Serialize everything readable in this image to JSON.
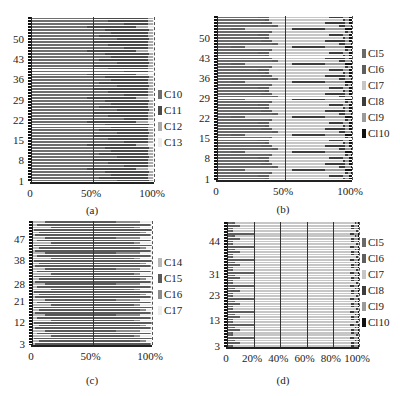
{
  "colors": {
    "C10": "#6e6e6e",
    "C11": "#4a4a4a",
    "C12": "#a9a9a9",
    "C13": "#ececec",
    "C14": "#b8b8b8",
    "C15": "#5a5a5a",
    "C16": "#8c8c8c",
    "C17": "#ededed",
    "Cl5": "#6a6a6a",
    "Cl6": "#5e5e5e",
    "Cl7": "#c6c6c6",
    "Cl8": "#3c3c3c",
    "Cl9": "#9a9a9a",
    "Cl10": "#111111"
  },
  "chart_data": [
    {
      "id": "a",
      "type": "bar",
      "orientation": "horizontal",
      "stacked": "percent",
      "caption": "(a)",
      "y_ticks": [
        "1",
        "8",
        "15",
        "22",
        "29",
        "36",
        "43",
        "50"
      ],
      "x_ticks": [
        "0",
        "50%",
        "100%"
      ],
      "legend": [
        "C10",
        "C11",
        "C12",
        "C13"
      ],
      "rows": 56,
      "series_pattern": [
        [
          70,
          26,
          3,
          1
        ],
        [
          55,
          40,
          4,
          1
        ],
        [
          65,
          30,
          4,
          1
        ],
        [
          60,
          36,
          3,
          1
        ],
        [
          45,
          40,
          10,
          5
        ],
        [
          75,
          20,
          4,
          1
        ],
        [
          62,
          33,
          4,
          1
        ],
        [
          50,
          45,
          4,
          1
        ]
      ]
    },
    {
      "id": "b",
      "type": "bar",
      "orientation": "horizontal",
      "stacked": "percent",
      "caption": "(b)",
      "y_ticks": [
        "1",
        "8",
        "15",
        "22",
        "29",
        "36",
        "43",
        "50"
      ],
      "x_ticks": [
        "0",
        "50%",
        "100%"
      ],
      "legend": [
        "Cl5",
        "Cl6",
        "Cl7",
        "Cl8",
        "Cl9",
        "Cl10"
      ],
      "rows": 56,
      "series_pattern": [
        [
          35,
          3,
          55,
          2,
          3,
          2
        ],
        [
          30,
          8,
          45,
          10,
          5,
          2
        ],
        [
          38,
          2,
          55,
          2,
          2,
          1
        ],
        [
          10,
          10,
          35,
          25,
          15,
          5
        ],
        [
          40,
          5,
          45,
          5,
          4,
          1
        ],
        [
          32,
          8,
          40,
          15,
          3,
          2
        ]
      ]
    },
    {
      "id": "c",
      "type": "bar",
      "orientation": "horizontal",
      "stacked": "percent",
      "caption": "(c)",
      "y_ticks": [
        "3",
        "12",
        "21",
        "28",
        "38",
        "47"
      ],
      "x_ticks": [
        "0",
        "50%",
        "100%"
      ],
      "legend": [
        "C14",
        "C15",
        "C16",
        "C17"
      ],
      "rows": 48,
      "series_pattern": [
        [
          2,
          96,
          1,
          1
        ],
        [
          5,
          85,
          5,
          5
        ],
        [
          1,
          98,
          1,
          0
        ],
        [
          15,
          70,
          5,
          10
        ],
        [
          3,
          95,
          1,
          1
        ],
        [
          10,
          60,
          20,
          10
        ]
      ]
    },
    {
      "id": "d",
      "type": "bar",
      "orientation": "horizontal",
      "stacked": "percent",
      "caption": "(d)",
      "y_ticks": [
        "3",
        "13",
        "23",
        "31",
        "44"
      ],
      "x_ticks": [
        "0",
        "20%",
        "40%",
        "60%",
        "80%",
        "100%"
      ],
      "legend": [
        "Cl5",
        "Cl6",
        "Cl7",
        "Cl8",
        "Cl9",
        "Cl10"
      ],
      "rows": 48,
      "series_pattern": [
        [
          2,
          2,
          90,
          2,
          3,
          1
        ],
        [
          1,
          8,
          85,
          2,
          3,
          1
        ],
        [
          3,
          2,
          92,
          1,
          1,
          1
        ],
        [
          1,
          20,
          72,
          3,
          3,
          1
        ],
        [
          2,
          2,
          94,
          1,
          1,
          0
        ]
      ]
    }
  ]
}
